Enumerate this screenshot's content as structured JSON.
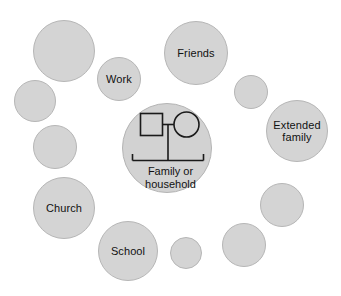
{
  "diagram": {
    "fill_color": "#d4d4d4",
    "stroke_color": "#b6b6b6",
    "line_color": "#1a1a1a",
    "background_color": "#ffffff"
  },
  "central": {
    "label": "Family or\nhousehold",
    "genogram": {
      "male_symbol": "square",
      "female_symbol": "circle"
    }
  },
  "nodes": [
    {
      "id": "node-top-left",
      "label": "",
      "cx": 64,
      "cy": 51,
      "r": 31
    },
    {
      "id": "node-work",
      "label": "Work",
      "cx": 119,
      "cy": 79,
      "r": 22
    },
    {
      "id": "node-friends",
      "label": "Friends",
      "cx": 196,
      "cy": 53,
      "r": 32
    },
    {
      "id": "node-upper-right",
      "label": "",
      "cx": 251,
      "cy": 92,
      "r": 17
    },
    {
      "id": "node-extended",
      "label": "Extended\nfamily",
      "cx": 297,
      "cy": 131,
      "r": 31
    },
    {
      "id": "node-left-upper",
      "label": "",
      "cx": 35,
      "cy": 101,
      "r": 21
    },
    {
      "id": "node-left-mid",
      "label": "",
      "cx": 55,
      "cy": 147,
      "r": 22
    },
    {
      "id": "node-church",
      "label": "Church",
      "cx": 64,
      "cy": 208,
      "r": 31
    },
    {
      "id": "node-school",
      "label": "School",
      "cx": 128,
      "cy": 251,
      "r": 30
    },
    {
      "id": "node-bottom-small",
      "label": "",
      "cx": 186,
      "cy": 253,
      "r": 16
    },
    {
      "id": "node-bottom-right",
      "label": "",
      "cx": 244,
      "cy": 245,
      "r": 22
    },
    {
      "id": "node-right-lower",
      "label": "",
      "cx": 282,
      "cy": 205,
      "r": 22
    }
  ],
  "central_node": {
    "cx": 167,
    "cy": 148,
    "r": 45
  }
}
